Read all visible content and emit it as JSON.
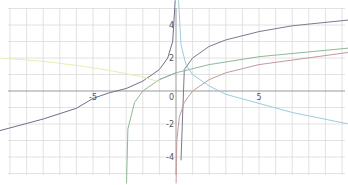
{
  "chart_data": {
    "type": "line",
    "title": "",
    "xlabel": "",
    "ylabel": "",
    "xlim": [
      -10.6,
      10.4
    ],
    "ylim": [
      -5.6,
      5.5
    ],
    "grid": true,
    "legend": "none",
    "x_ticks": [
      {
        "value": -5,
        "label": "-5"
      },
      {
        "value": 5,
        "label": "5"
      }
    ],
    "y_ticks": [
      {
        "value": 4,
        "label": "4"
      },
      {
        "value": 2,
        "label": "2"
      },
      {
        "value": 0,
        "label": "0"
      },
      {
        "value": -2,
        "label": "-2"
      },
      {
        "value": -4,
        "label": "-4"
      }
    ],
    "series": [
      {
        "name": "dark-gray-left",
        "color": "#6f6f8a",
        "points": [
          [
            -10.6,
            -2.4
          ],
          [
            -8,
            -1.7
          ],
          [
            -6,
            -1.05
          ],
          [
            -5,
            -0.45
          ],
          [
            -4,
            -0.1
          ],
          [
            -3,
            0.15
          ],
          [
            -2,
            0.6
          ],
          [
            -1,
            1.3
          ],
          [
            -0.5,
            2.0
          ],
          [
            -0.2,
            3.0
          ],
          [
            -0.05,
            5.5
          ]
        ]
      },
      {
        "name": "dark-gray-right",
        "color": "#7a7a8e",
        "points": [
          [
            0.3,
            -4.2
          ],
          [
            0.5,
            1.3
          ],
          [
            1,
            2.0
          ],
          [
            2,
            2.7
          ],
          [
            3,
            3.1
          ],
          [
            5,
            3.6
          ],
          [
            7,
            3.95
          ],
          [
            10.4,
            4.3
          ]
        ]
      },
      {
        "name": "green-ln-x-plus-3",
        "color": "#8fb996",
        "points": [
          [
            -2.98,
            -5.6
          ],
          [
            -2.9,
            -2.3
          ],
          [
            -2.5,
            -0.7
          ],
          [
            -2,
            0
          ],
          [
            -1,
            0.69
          ],
          [
            0,
            1.1
          ],
          [
            2,
            1.6
          ],
          [
            5,
            2.08
          ],
          [
            10.4,
            2.6
          ]
        ]
      },
      {
        "name": "red-ln-x",
        "color": "#c49a9a",
        "points": [
          [
            0.004,
            -5.6
          ],
          [
            0.05,
            -3.0
          ],
          [
            0.2,
            -1.6
          ],
          [
            0.5,
            -0.69
          ],
          [
            1,
            0
          ],
          [
            2,
            0.69
          ],
          [
            3,
            1.1
          ],
          [
            5,
            1.6
          ],
          [
            10.4,
            2.34
          ]
        ]
      },
      {
        "name": "blue-decreasing",
        "color": "#9ccbe0",
        "points": [
          [
            0.15,
            5.5
          ],
          [
            0.3,
            2.8
          ],
          [
            0.6,
            1.6
          ],
          [
            1,
            1.0
          ],
          [
            2,
            0.3
          ],
          [
            3,
            -0.2
          ],
          [
            5,
            -0.75
          ],
          [
            7,
            -1.3
          ],
          [
            10.4,
            -2.0
          ]
        ]
      },
      {
        "name": "yellow-faint",
        "color": "#ecebb4",
        "points": [
          [
            -10.6,
            2.0
          ],
          [
            -8,
            1.8
          ],
          [
            -6,
            1.55
          ],
          [
            -4,
            1.25
          ],
          [
            -2,
            0.85
          ],
          [
            -1,
            0.55
          ]
        ]
      },
      {
        "name": "teal-line",
        "color": "#8fb0a6",
        "points": [
          [
            -1,
            0.7
          ],
          [
            0,
            1.1
          ]
        ]
      }
    ]
  },
  "axes": {
    "origin_label": "0"
  }
}
